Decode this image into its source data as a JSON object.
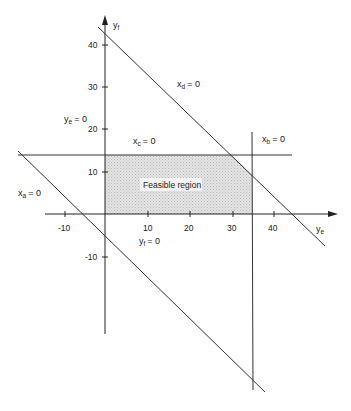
{
  "diagram": {
    "title": "Feasible region",
    "type": "linear-programming-feasible-region",
    "axes": {
      "x": {
        "label_main": "y",
        "label_sub": "e",
        "ticks": [
          "-10",
          "10",
          "20",
          "30",
          "40"
        ]
      },
      "y": {
        "label_main": "y",
        "label_sub": "f",
        "ticks": [
          "40",
          "30",
          "20",
          "10",
          "-10"
        ]
      }
    },
    "constraints": [
      {
        "id": "xa",
        "main": "x",
        "sub": "a",
        "eq": "= 0"
      },
      {
        "id": "xb",
        "main": "x",
        "sub": "b",
        "eq": "= 0"
      },
      {
        "id": "xc",
        "main": "x",
        "sub": "c",
        "eq": "= 0"
      },
      {
        "id": "xd",
        "main": "x",
        "sub": "d",
        "eq": "= 0"
      },
      {
        "id": "ye",
        "main": "y",
        "sub": "e",
        "eq": "= 0"
      },
      {
        "id": "yf",
        "main": "y",
        "sub": "f",
        "eq": "= 0"
      }
    ],
    "region_label": "Feasible region",
    "colors": {
      "line": "#333333",
      "shade": "#d8d8d8",
      "background": "#ffffff"
    }
  }
}
